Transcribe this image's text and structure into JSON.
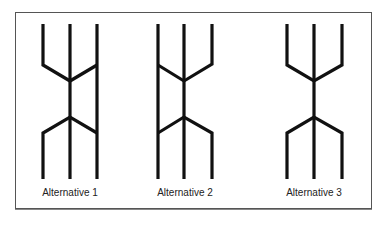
{
  "diagram": {
    "alternatives": [
      {
        "label": "Alternative 1",
        "lines": {
          "left": 43,
          "center": 70,
          "right": 97
        },
        "description": "left and right top branches merge into center; bottom splits to left and right; right line continuous"
      },
      {
        "label": "Alternative 2",
        "lines": {
          "left": 158,
          "center": 184,
          "right": 212
        },
        "description": "left line continuous; right top branch merges into center; bottom splits to left and right"
      },
      {
        "label": "Alternative 3",
        "lines": {
          "left": 287,
          "center": 314,
          "right": 342
        },
        "description": "left and right top branches merge into center; center splits to left and right at bottom"
      }
    ],
    "stroke_color": "#111111",
    "frame_color": "#555555"
  }
}
